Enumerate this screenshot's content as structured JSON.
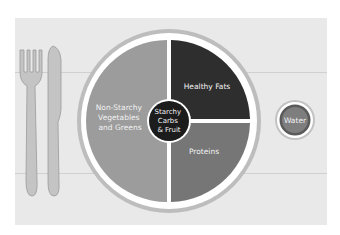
{
  "diagram": {
    "plate": {
      "sections": [
        {
          "id": "non-starchy",
          "lines": [
            "Non-Starchy",
            "Vegetables",
            "and Greens"
          ],
          "color": "#9c9c9c"
        },
        {
          "id": "healthy-fats",
          "lines": [
            "Healthy Fats"
          ],
          "color": "#2e2e2e"
        },
        {
          "id": "proteins",
          "lines": [
            "Proteins"
          ],
          "color": "#767676"
        }
      ],
      "center": {
        "lines": [
          "Starchy",
          "Carbs",
          "& Fruit"
        ],
        "color": "#1c1c1c"
      }
    },
    "side_glass": {
      "label": "Water",
      "color": "#7e7e7e"
    },
    "cutlery": [
      "fork",
      "knife"
    ],
    "colors": {
      "placemat": "#e9e9e9",
      "plate_rim": "#bdbdbd",
      "plate_white": "#ffffff"
    }
  }
}
